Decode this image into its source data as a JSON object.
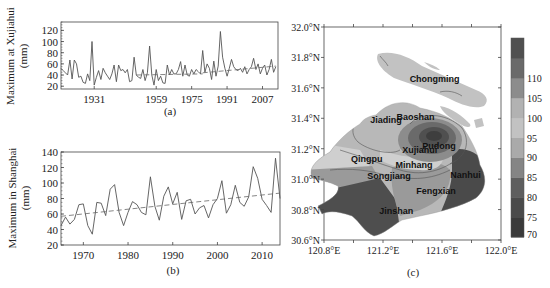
{
  "chart_data": [
    {
      "id": "a",
      "type": "line",
      "panel_label": "(a)",
      "title": "",
      "xlabel": "",
      "ylabel": "Maximum at Xujiahui\n(mm)",
      "ylabel_lines": [
        "Maximum at Xujiahui",
        "(mm)"
      ],
      "xlim": [
        1916,
        2014
      ],
      "ylim": [
        15,
        135
      ],
      "xticks": [
        1931,
        1959,
        1975,
        1991,
        2007
      ],
      "xtick_labels": [
        "1931",
        "1959",
        "1975",
        "1991",
        "2007"
      ],
      "yticks": [
        20,
        40,
        60,
        80,
        100,
        120
      ],
      "ytick_labels": [
        "20",
        "40",
        "60",
        "80",
        "100",
        "120"
      ],
      "grid": false,
      "x": [
        1916,
        1917,
        1918,
        1919,
        1920,
        1921,
        1922,
        1923,
        1924,
        1925,
        1926,
        1927,
        1928,
        1929,
        1930,
        1931,
        1932,
        1933,
        1934,
        1935,
        1936,
        1937,
        1938,
        1939,
        1940,
        1941,
        1942,
        1943,
        1944,
        1945,
        1946,
        1947,
        1948,
        1949,
        1950,
        1951,
        1952,
        1953,
        1954,
        1955,
        1956,
        1957,
        1958,
        1959,
        1960,
        1961,
        1962,
        1963,
        1964,
        1965,
        1966,
        1967,
        1968,
        1969,
        1970,
        1971,
        1972,
        1973,
        1974,
        1975,
        1976,
        1977,
        1978,
        1979,
        1980,
        1981,
        1982,
        1983,
        1984,
        1985,
        1986,
        1987,
        1988,
        1989,
        1990,
        1991,
        1992,
        1993,
        1994,
        1995,
        1996,
        1997,
        1998,
        1999,
        2000,
        2001,
        2002,
        2003,
        2004,
        2005,
        2006,
        2007,
        2008,
        2009,
        2010,
        2011,
        2012,
        2013
      ],
      "series": [
        {
          "name": "Annual maximum",
          "style": "solid",
          "values": [
            52,
            48,
            44,
            40,
            67,
            33,
            67,
            60,
            36,
            38,
            27,
            25,
            42,
            30,
            100,
            22,
            36,
            48,
            32,
            52,
            44,
            38,
            32,
            42,
            58,
            28,
            58,
            48,
            50,
            44,
            50,
            28,
            30,
            72,
            40,
            36,
            34,
            50,
            30,
            44,
            92,
            40,
            22,
            50,
            30,
            38,
            26,
            25,
            58,
            40,
            50,
            42,
            42,
            50,
            64,
            38,
            58,
            40,
            38,
            50,
            42,
            50,
            46,
            42,
            84,
            45,
            60,
            52,
            32,
            65,
            38,
            56,
            118,
            72,
            52,
            38,
            52,
            68,
            55,
            50,
            48,
            52,
            45,
            55,
            42,
            50,
            55,
            70,
            50,
            60,
            42,
            52,
            58,
            40,
            50,
            68,
            45,
            55
          ]
        },
        {
          "name": "Linear trend (after 1980)",
          "style": "dashed",
          "x_range": [
            1980,
            2013
          ],
          "values": [
            44,
            56
          ]
        },
        {
          "name": "Mean (before 1980)",
          "style": "dashed",
          "x_range": [
            1950,
            1980
          ],
          "values": [
            40,
            42
          ]
        }
      ]
    },
    {
      "id": "b",
      "type": "line",
      "panel_label": "(b)",
      "title": "",
      "xlabel": "",
      "ylabel": "Maximum in Shanghai\n(mm)",
      "ylabel_lines": [
        "Maximum in Shanghai",
        "(mm)"
      ],
      "xlim": [
        1965,
        2014
      ],
      "ylim": [
        20,
        140
      ],
      "xticks": [
        1970,
        1980,
        1990,
        2000,
        2010
      ],
      "xtick_labels": [
        "1970",
        "1980",
        "1990",
        "2000",
        "2010"
      ],
      "yticks": [
        20,
        40,
        60,
        80,
        100,
        120,
        140
      ],
      "ytick_labels": [
        "20",
        "40",
        "60",
        "80",
        "100",
        "120",
        "140"
      ],
      "grid": false,
      "x": [
        1965,
        1966,
        1967,
        1968,
        1969,
        1970,
        1971,
        1972,
        1973,
        1974,
        1975,
        1976,
        1977,
        1978,
        1979,
        1980,
        1981,
        1982,
        1983,
        1984,
        1985,
        1986,
        1987,
        1988,
        1989,
        1990,
        1991,
        1992,
        1993,
        1994,
        1995,
        1996,
        1997,
        1998,
        1999,
        2000,
        2001,
        2002,
        2003,
        2004,
        2005,
        2006,
        2007,
        2008,
        2009,
        2010,
        2011,
        2012,
        2013,
        2014
      ],
      "series": [
        {
          "name": "Annual maximum",
          "style": "solid",
          "values": [
            45,
            56,
            47,
            53,
            72,
            73,
            45,
            34,
            75,
            74,
            58,
            92,
            98,
            62,
            45,
            62,
            76,
            72,
            62,
            59,
            108,
            70,
            52,
            83,
            95,
            73,
            88,
            53,
            77,
            79,
            60,
            68,
            71,
            55,
            72,
            80,
            103,
            61,
            72,
            97,
            75,
            70,
            82,
            121,
            106,
            79,
            71,
            62,
            132,
            80
          ]
        },
        {
          "name": "Linear trend",
          "style": "dashed",
          "x_range": [
            1965,
            2014
          ],
          "values": [
            57,
            87
          ]
        }
      ]
    },
    {
      "id": "c",
      "type": "heatmap",
      "panel_label": "(c)",
      "title": "",
      "xlabel": "",
      "ylabel": "",
      "xlim": [
        120.8,
        122.0
      ],
      "ylim": [
        30.6,
        32.0
      ],
      "xticks": [
        120.8,
        121.2,
        121.6,
        122.0
      ],
      "xtick_labels": [
        "120.8°E",
        "121.2°E",
        "121.6°E",
        "122.0°E"
      ],
      "yticks": [
        30.6,
        30.8,
        31.0,
        31.2,
        31.4,
        31.6,
        31.8,
        32.0
      ],
      "ytick_labels": [
        "30.6°N",
        "30.8°N",
        "31.0°N",
        "31.2°N",
        "31.4°N",
        "31.6°N",
        "31.8°N",
        "32.0°N"
      ],
      "colorbar": {
        "levels": [
          70,
          75,
          80,
          85,
          90,
          95,
          100,
          105,
          110
        ],
        "tick_labels": [
          "70",
          "75",
          "80",
          "85",
          "90",
          "95",
          "100",
          "105",
          "110"
        ],
        "colors": [
          "#3a3a3a",
          "#4a4a4a",
          "#5e5e5e",
          "#858585",
          "#aaaaaa",
          "#c2c2c2",
          "#b2b2b2",
          "#8c8c8c",
          "#6a6a6a",
          "#505050"
        ],
        "position": "right"
      },
      "districts": [
        {
          "name": "Chongming",
          "lon": 121.55,
          "lat": 31.66,
          "approx_value": 95
        },
        {
          "name": "Baoshan",
          "lon": 121.42,
          "lat": 31.41,
          "approx_value": 95
        },
        {
          "name": "Jiading",
          "lon": 121.22,
          "lat": 31.39,
          "approx_value": 95
        },
        {
          "name": "Pudong",
          "lon": 121.58,
          "lat": 31.22,
          "approx_value": 110
        },
        {
          "name": "Xujiahui",
          "lon": 121.45,
          "lat": 31.19,
          "approx_value": 110
        },
        {
          "name": "Qingpu",
          "lon": 121.09,
          "lat": 31.13,
          "approx_value": 90
        },
        {
          "name": "Minhang",
          "lon": 121.41,
          "lat": 31.09,
          "approx_value": 95
        },
        {
          "name": "Songjiang",
          "lon": 121.24,
          "lat": 31.02,
          "approx_value": 85
        },
        {
          "name": "Nanhui",
          "lon": 121.76,
          "lat": 31.03,
          "approx_value": 75
        },
        {
          "name": "Fengxian",
          "lon": 121.56,
          "lat": 30.92,
          "approx_value": 85
        },
        {
          "name": "Jinshan",
          "lon": 121.29,
          "lat": 30.79,
          "approx_value": 72
        }
      ]
    }
  ]
}
